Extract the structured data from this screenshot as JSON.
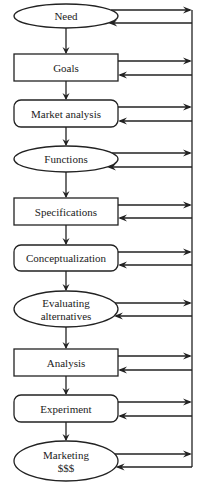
{
  "diagram": {
    "type": "flowchart",
    "colors": {
      "stroke": "#222222",
      "background": "#ffffff",
      "text": "#222222"
    },
    "feedback_bus_x": 192,
    "nodes": [
      {
        "id": "need",
        "label": "Need",
        "lines": [
          "Need"
        ],
        "shape": "ellipse",
        "x": 14,
        "y": 4,
        "w": 104,
        "h": 24,
        "out_y": 10,
        "in_y": 23
      },
      {
        "id": "goals",
        "label": "Goals",
        "lines": [
          "Goals"
        ],
        "shape": "rect",
        "x": 14,
        "y": 54,
        "w": 104,
        "h": 27,
        "out_y": 61,
        "in_y": 75
      },
      {
        "id": "market-analysis",
        "label": "Market analysis",
        "lines": [
          "Market analysis"
        ],
        "shape": "rounded",
        "x": 14,
        "y": 100,
        "w": 104,
        "h": 27,
        "out_y": 107,
        "in_y": 121
      },
      {
        "id": "functions",
        "label": "Functions",
        "lines": [
          "Functions"
        ],
        "shape": "ellipse",
        "x": 14,
        "y": 146,
        "w": 104,
        "h": 26,
        "out_y": 153,
        "in_y": 167
      },
      {
        "id": "specifications",
        "label": "Specifications",
        "lines": [
          "Specifications"
        ],
        "shape": "rect",
        "x": 14,
        "y": 198,
        "w": 104,
        "h": 27,
        "out_y": 205,
        "in_y": 218
      },
      {
        "id": "conceptualization",
        "label": "Conceptualization",
        "lines": [
          "Conceptualization"
        ],
        "shape": "rounded",
        "x": 14,
        "y": 245,
        "w": 104,
        "h": 26,
        "out_y": 252,
        "in_y": 265
      },
      {
        "id": "evaluating-alternatives",
        "label": "Evaluating alternatives",
        "lines": [
          "Evaluating",
          "alternatives"
        ],
        "shape": "ellipse",
        "x": 14,
        "y": 291,
        "w": 104,
        "h": 36,
        "out_y": 303,
        "in_y": 316
      },
      {
        "id": "analysis",
        "label": "Analysis",
        "lines": [
          "Analysis"
        ],
        "shape": "rect",
        "x": 14,
        "y": 349,
        "w": 104,
        "h": 27,
        "out_y": 356,
        "in_y": 370
      },
      {
        "id": "experiment",
        "label": "Experiment",
        "lines": [
          "Experiment"
        ],
        "shape": "rounded",
        "x": 14,
        "y": 395,
        "w": 104,
        "h": 27,
        "out_y": 402,
        "in_y": 416
      },
      {
        "id": "marketing",
        "label": "Marketing $$$",
        "lines": [
          "Marketing",
          "$$$"
        ],
        "shape": "ellipse",
        "x": 14,
        "y": 441,
        "w": 104,
        "h": 40,
        "out_y": 454,
        "in_y": 467
      }
    ],
    "edges": [
      {
        "from": "need",
        "to": "goals"
      },
      {
        "from": "goals",
        "to": "market-analysis"
      },
      {
        "from": "market-analysis",
        "to": "functions"
      },
      {
        "from": "functions",
        "to": "specifications"
      },
      {
        "from": "specifications",
        "to": "conceptualization"
      },
      {
        "from": "conceptualization",
        "to": "evaluating-alternatives"
      },
      {
        "from": "evaluating-alternatives",
        "to": "analysis"
      },
      {
        "from": "analysis",
        "to": "experiment"
      },
      {
        "from": "experiment",
        "to": "marketing"
      }
    ],
    "feedback": "Every step sends an arrow right to a shared vertical feedback bus and receives an arrow back from it"
  }
}
